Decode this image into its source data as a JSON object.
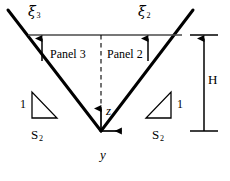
{
  "figure": {
    "name": "v-shaped-channel-cross-section-diagram",
    "colors": {
      "stroke": "#000000",
      "thin_stroke": "#3a3a3a",
      "background": "#ffffff"
    },
    "labels": {
      "xi_left": {
        "symbol": "ξ",
        "subscript": "3"
      },
      "xi_right": {
        "symbol": "ξ",
        "subscript": "2"
      },
      "panel_left": "Panel 3",
      "panel_right": "Panel 2",
      "axis_vertical": "z",
      "axis_horizontal": "y",
      "height_dimension": "H",
      "slope_rise_left": "1",
      "slope_rise_right": "1",
      "slope_run_left": {
        "symbol": "S",
        "subscript": "2"
      },
      "slope_run_right": {
        "symbol": "S",
        "subscript": "2"
      }
    },
    "geometry": {
      "origin": {
        "x": 101,
        "y": 131
      },
      "left_bank_top": {
        "x": 8,
        "y": 10
      },
      "right_bank_top": {
        "x": 193,
        "y": 10
      },
      "water_surface_line": {
        "x1": 28,
        "x2": 182,
        "y": 35
      },
      "centerline_dashed": {
        "x": 101,
        "y1": 35,
        "y2": 112
      },
      "xi_arrow_left": {
        "x": 42,
        "y_bottom": 61,
        "y_top": 36
      },
      "xi_arrow_right": {
        "x": 148,
        "y_bottom": 61,
        "y_top": 36
      },
      "z_axis_arrow": {
        "x": 101,
        "y_bottom": 131,
        "y_top": 106
      },
      "y_axis_arrow": {
        "y": 131,
        "x_left": 101,
        "x_right": 124
      },
      "height_dimension_line": {
        "x": 204,
        "y_top": 35,
        "y_bottom": 131
      },
      "triangle_left": {
        "x1": 32,
        "y1": 92,
        "x2": 32,
        "y2": 118,
        "x3": 57,
        "y3": 118
      },
      "triangle_right": {
        "x1": 171,
        "y1": 92,
        "x2": 171,
        "y2": 118,
        "x3": 146,
        "y3": 118
      }
    }
  }
}
